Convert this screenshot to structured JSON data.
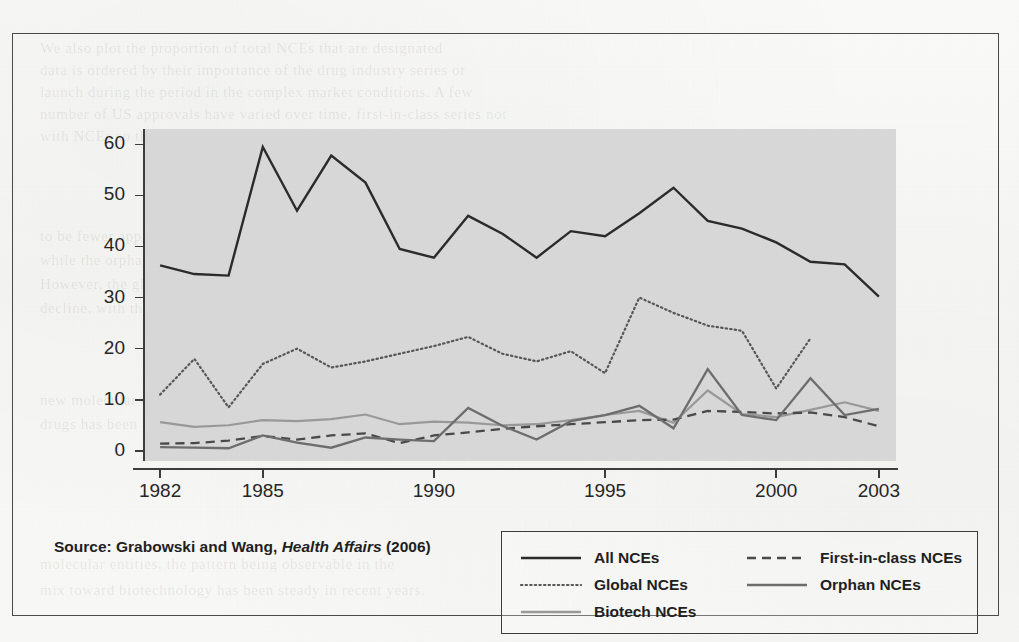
{
  "source_note": {
    "prefix": "Source: Grabowski and Wang, ",
    "journal": "Health Affairs",
    "suffix": " (2006)"
  },
  "legend": {
    "items": [
      {
        "label": "All NCEs",
        "style": "solid-dark",
        "color": "#2b2b2b"
      },
      {
        "label": "First-in-class NCEs",
        "style": "dashed",
        "color": "#4a4a4a"
      },
      {
        "label": "Global NCEs",
        "style": "dotted",
        "color": "#585858"
      },
      {
        "label": "Orphan NCEs",
        "style": "solid-medium",
        "color": "#6e6e6e"
      },
      {
        "label": "Biotech NCEs",
        "style": "solid-light",
        "color": "#9a9a9a"
      }
    ]
  },
  "ghost_text": [
    {
      "x": 40,
      "y": 40,
      "text": "We also plot the proportion of total NCEs that are designated"
    },
    {
      "x": 40,
      "y": 62,
      "text": "data is ordered by their importance of the drug industry series or"
    },
    {
      "x": 40,
      "y": 84,
      "text": "launch during the period in the complex market conditions. A few"
    },
    {
      "x": 40,
      "y": 106,
      "text": "number of US approvals have varied over time, first-in-class series not"
    },
    {
      "x": 40,
      "y": 128,
      "text": "with NCEs so that it reflects the drug policies of approval and the scale."
    },
    {
      "x": 40,
      "y": 228,
      "text": "to be fewer approvals in the later period than in the earlier era,"
    },
    {
      "x": 40,
      "y": 252,
      "text": "while the orphan drugs and biotech NCEs has rapidly risen."
    },
    {
      "x": 40,
      "y": 276,
      "text": "However, the global new chemical entity counts show a relative"
    },
    {
      "x": 40,
      "y": 300,
      "text": "decline, with the share of approvals in the rest of the world rising."
    },
    {
      "x": 40,
      "y": 392,
      "text": "new molecular entities that are classified as orphan or biotech"
    },
    {
      "x": 40,
      "y": 416,
      "text": "drugs has been accelerating."
    },
    {
      "x": 40,
      "y": 556,
      "text": "molecular entities, the pattern being observable in the"
    },
    {
      "x": 40,
      "y": 582,
      "text": "mix toward biotechnology has been steady in recent years."
    }
  ],
  "chart_data": {
    "type": "line",
    "title": "",
    "xlabel": "",
    "ylabel": "",
    "xlim": [
      1981.5,
      2003.5
    ],
    "ylim": [
      -2,
      63
    ],
    "grid": false,
    "legend_position": "bottom-right",
    "x_tick_labels": [
      "1982",
      "1985",
      "1990",
      "1995",
      "2000",
      "2003"
    ],
    "x_ticks": [
      1982,
      1985,
      1990,
      1995,
      2000,
      2003
    ],
    "y_tick_labels": [
      "0",
      "10",
      "20",
      "30",
      "40",
      "50",
      "60"
    ],
    "y_ticks": [
      0,
      10,
      20,
      30,
      40,
      50,
      60
    ],
    "x": [
      1982,
      1983,
      1984,
      1985,
      1986,
      1987,
      1988,
      1989,
      1990,
      1991,
      1992,
      1993,
      1994,
      1995,
      1996,
      1997,
      1998,
      1999,
      2000,
      2001,
      2002,
      2003
    ],
    "series": [
      {
        "name": "All NCEs",
        "style": "solid-dark",
        "color": "#2b2b2b",
        "width": 2.4,
        "values": [
          36.3,
          34.6,
          34.3,
          59.5,
          47.0,
          57.8,
          52.5,
          39.5,
          37.8,
          46.0,
          42.5,
          37.8,
          43.0,
          42.0,
          46.5,
          51.5,
          45.0,
          43.5,
          40.8,
          37.0,
          36.5,
          30.2
        ]
      },
      {
        "name": "Global NCEs",
        "style": "dotted",
        "color": "#585858",
        "width": 2.2,
        "values": [
          11.0,
          18.0,
          8.5,
          17.0,
          20.0,
          16.3,
          17.5,
          19.0,
          20.5,
          22.3,
          19.0,
          17.5,
          19.5,
          15.2,
          30.0,
          27.0,
          24.5,
          23.5,
          12.2,
          22.0,
          null,
          null
        ]
      },
      {
        "name": "Biotech NCEs",
        "style": "solid-light",
        "color": "#9a9a9a",
        "width": 2.2,
        "values": [
          5.6,
          4.7,
          5.0,
          6.0,
          5.8,
          6.2,
          7.1,
          5.2,
          5.7,
          5.5,
          5.0,
          5.2,
          6.0,
          7.0,
          7.8,
          5.5,
          11.8,
          7.2,
          6.6,
          8.0,
          9.5,
          7.8
        ]
      },
      {
        "name": "First-in-class NCEs",
        "style": "dashed",
        "color": "#4a4a4a",
        "width": 2.3,
        "values": [
          1.4,
          1.5,
          2.0,
          2.9,
          2.2,
          3.0,
          3.4,
          1.5,
          3.0,
          3.6,
          4.3,
          4.8,
          5.2,
          5.6,
          6.0,
          6.1,
          7.8,
          7.6,
          7.3,
          7.5,
          6.6,
          4.8
        ]
      },
      {
        "name": "Orphan NCEs",
        "style": "solid-medium",
        "color": "#6e6e6e",
        "width": 2.3,
        "values": [
          0.7,
          0.6,
          0.5,
          3.0,
          1.6,
          0.6,
          2.6,
          2.2,
          1.9,
          8.4,
          4.9,
          2.2,
          5.8,
          7.0,
          8.8,
          4.4,
          16.0,
          7.0,
          6.0,
          14.2,
          7.0,
          8.2
        ]
      }
    ]
  }
}
